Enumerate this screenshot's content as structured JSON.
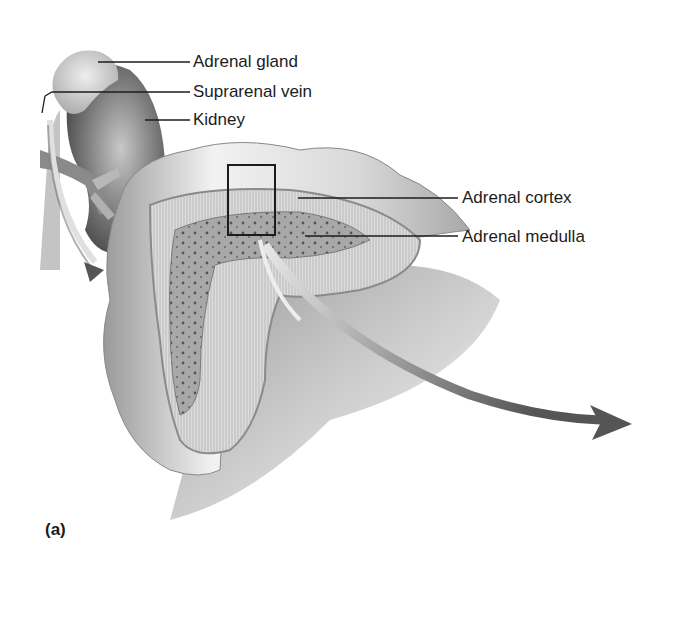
{
  "figure": {
    "panel_label": "(a)",
    "labels": [
      {
        "id": "adrenal-gland",
        "text": "Adrenal gland"
      },
      {
        "id": "suprarenal-vein",
        "text": "Suprarenal vein"
      },
      {
        "id": "kidney",
        "text": "Kidney"
      },
      {
        "id": "adrenal-cortex",
        "text": "Adrenal cortex"
      },
      {
        "id": "adrenal-medulla",
        "text": "Adrenal medulla"
      }
    ],
    "colors": {
      "text": "#1c1c1c",
      "leader_line": "#1c1c1c",
      "tissue_light": "#e6e6e6",
      "tissue_mid": "#bdbdbd",
      "tissue_dark": "#6a6a6a",
      "medulla": "#9a9a9a",
      "arrow": "#6e6e6e"
    }
  }
}
